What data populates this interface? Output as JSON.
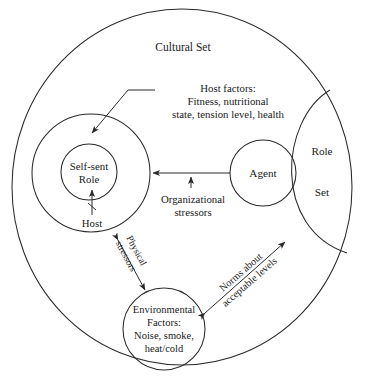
{
  "diagram": {
    "title": "Cultural Set",
    "labels": {
      "cultural_set": "Cultural Set",
      "host_factors_line1": "Host factors:",
      "host_factors_line2": "Fitness, nutritional",
      "host_factors_line3": "state, tension level, health",
      "self_sent_line1": "Self-sent",
      "self_sent_line2": "Role",
      "host": "Host",
      "agent": "Agent",
      "role": "Role",
      "set": "Set",
      "organizational_line1": "Organizational",
      "organizational_line2": "stressors",
      "environmental_line1": "Environmental",
      "environmental_line2": "Factors:",
      "environmental_line3": "Noise, smoke,",
      "environmental_line4": "heat/cold",
      "physical_line1": "Physical",
      "physical_line2": "stressors",
      "norms_line1": "Norms about",
      "norms_line2": "acceptable levels"
    },
    "colors": {
      "stroke": "#2a2a2a",
      "text": "#1a1a1a",
      "background": "#ffffff"
    }
  }
}
